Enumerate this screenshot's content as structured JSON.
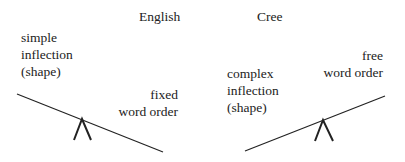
{
  "diagram": {
    "left": {
      "language": "English",
      "upper_label": [
        "simple",
        "inflection",
        "(shape)"
      ],
      "lower_label": [
        "fixed",
        "word order"
      ]
    },
    "right": {
      "language": "Cree",
      "lower_label": [
        "complex",
        "inflection",
        "(shape)"
      ],
      "upper_label": [
        "free",
        "word order"
      ]
    },
    "colors": {
      "line": "#222222",
      "text": "#222222",
      "background": "#ffffff"
    }
  }
}
